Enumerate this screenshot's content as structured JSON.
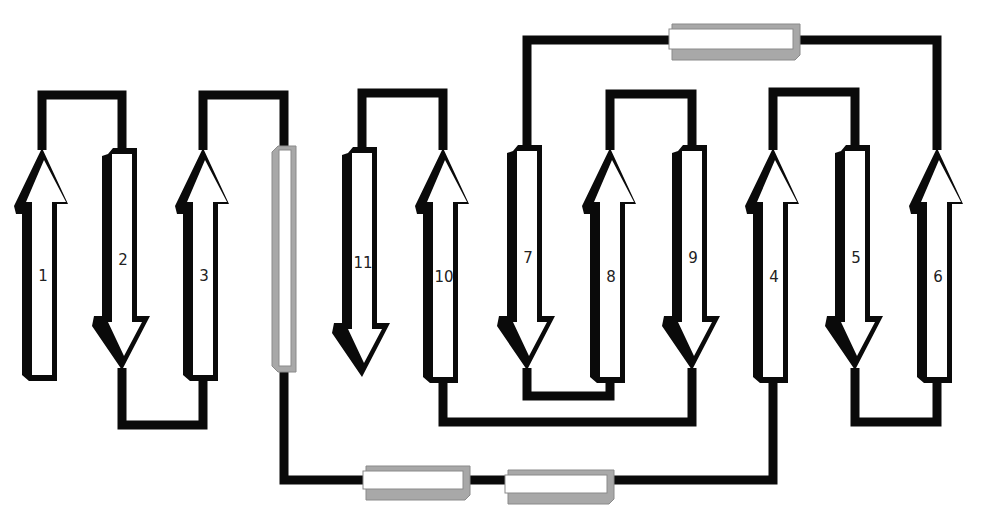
{
  "diagram": {
    "colors": {
      "line": "#0a0a0a",
      "arrow_fill": "#ffffff",
      "arrow_outline": "#0a0a0a",
      "helix_fill": "#ffffff",
      "helix_shade": "#a8a8a8",
      "label": "#222222"
    },
    "strands": [
      {
        "id": "1",
        "label": "1",
        "x": 42,
        "dir": "up",
        "top": 150,
        "bottom": 375
      },
      {
        "id": "2",
        "label": "2",
        "x": 122,
        "dir": "down",
        "top": 148,
        "bottom": 368
      },
      {
        "id": "3",
        "label": "3",
        "x": 203,
        "dir": "up",
        "top": 150,
        "bottom": 375
      },
      {
        "id": "11",
        "label": "11",
        "x": 362,
        "dir": "down",
        "top": 147,
        "bottom": 375
      },
      {
        "id": "10",
        "label": "10",
        "x": 443,
        "dir": "up",
        "top": 150,
        "bottom": 377
      },
      {
        "id": "7",
        "label": "7",
        "x": 527,
        "dir": "down",
        "top": 145,
        "bottom": 368
      },
      {
        "id": "8",
        "label": "8",
        "x": 610,
        "dir": "up",
        "top": 150,
        "bottom": 377
      },
      {
        "id": "9",
        "label": "9",
        "x": 692,
        "dir": "down",
        "top": 145,
        "bottom": 368
      },
      {
        "id": "4",
        "label": "4",
        "x": 773,
        "dir": "up",
        "top": 150,
        "bottom": 377
      },
      {
        "id": "5",
        "label": "5",
        "x": 855,
        "dir": "down",
        "top": 145,
        "bottom": 368
      },
      {
        "id": "6",
        "label": "6",
        "x": 937,
        "dir": "up",
        "top": 150,
        "bottom": 377
      }
    ],
    "helices": [
      {
        "id": "helix-vertical",
        "orientation": "vertical",
        "x": 272,
        "y": 146,
        "w": 24,
        "h": 226
      },
      {
        "id": "helix-top",
        "orientation": "horizontal",
        "x": 672,
        "y": 24,
        "w": 128,
        "h": 36
      },
      {
        "id": "helix-bottom-1",
        "orientation": "horizontal",
        "x": 366,
        "y": 466,
        "w": 104,
        "h": 34
      },
      {
        "id": "helix-bottom-2",
        "orientation": "horizontal",
        "x": 508,
        "y": 470,
        "w": 106,
        "h": 34
      }
    ],
    "loops": [
      {
        "id": "loop-1-2",
        "points": [
          [
            42,
            150
          ],
          [
            42,
            95
          ],
          [
            122,
            95
          ],
          [
            122,
            148
          ]
        ]
      },
      {
        "id": "loop-2-3",
        "points": [
          [
            122,
            368
          ],
          [
            122,
            425
          ],
          [
            203,
            425
          ],
          [
            203,
            375
          ]
        ]
      },
      {
        "id": "loop-3-helix",
        "points": [
          [
            203,
            150
          ],
          [
            203,
            95
          ],
          [
            284,
            95
          ],
          [
            284,
            146
          ]
        ]
      },
      {
        "id": "loop-helix-bottom",
        "points": [
          [
            284,
            372
          ],
          [
            284,
            480
          ],
          [
            366,
            480
          ]
        ]
      },
      {
        "id": "loop-bh1-bh2",
        "points": [
          [
            470,
            480
          ],
          [
            508,
            480
          ]
        ]
      },
      {
        "id": "loop-bh2-4",
        "points": [
          [
            614,
            480
          ],
          [
            773,
            480
          ],
          [
            773,
            377
          ]
        ]
      },
      {
        "id": "loop-4-5",
        "points": [
          [
            773,
            150
          ],
          [
            773,
            92
          ],
          [
            855,
            92
          ],
          [
            855,
            145
          ]
        ]
      },
      {
        "id": "loop-5-6",
        "points": [
          [
            855,
            368
          ],
          [
            855,
            422
          ],
          [
            937,
            422
          ],
          [
            937,
            377
          ]
        ]
      },
      {
        "id": "loop-6-tophelix",
        "points": [
          [
            937,
            150
          ],
          [
            937,
            40
          ],
          [
            800,
            40
          ]
        ]
      },
      {
        "id": "loop-tophelix-7",
        "points": [
          [
            672,
            40
          ],
          [
            527,
            40
          ],
          [
            527,
            145
          ]
        ]
      },
      {
        "id": "loop-7-8",
        "points": [
          [
            527,
            368
          ],
          [
            527,
            396
          ],
          [
            610,
            396
          ],
          [
            610,
            377
          ]
        ]
      },
      {
        "id": "loop-8-9",
        "points": [
          [
            610,
            150
          ],
          [
            610,
            94
          ],
          [
            692,
            94
          ],
          [
            692,
            145
          ]
        ]
      },
      {
        "id": "loop-9-10",
        "points": [
          [
            692,
            368
          ],
          [
            692,
            422
          ],
          [
            443,
            422
          ],
          [
            443,
            377
          ]
        ]
      },
      {
        "id": "loop-10-11",
        "points": [
          [
            443,
            150
          ],
          [
            443,
            93
          ],
          [
            362,
            93
          ],
          [
            362,
            147
          ]
        ]
      }
    ]
  }
}
